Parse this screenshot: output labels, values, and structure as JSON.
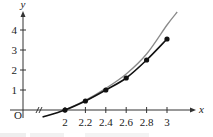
{
  "chart_data": {
    "type": "line",
    "title": "",
    "xlabel": "x",
    "ylabel": "y",
    "origin_label": "O",
    "x_ticks": [
      2,
      2.2,
      2.4,
      2.6,
      2.8,
      3
    ],
    "x_tick_labels": [
      "2",
      "2.2",
      "2.4",
      "2.6",
      "2.8",
      "3"
    ],
    "y_ticks": [
      1,
      2,
      3,
      4
    ],
    "y_tick_labels": [
      "1",
      "2",
      "3",
      "4"
    ],
    "xlim": [
      1.6,
      3.28
    ],
    "ylim": [
      0,
      4.8
    ],
    "axis_break": "x-axis break between 0 and 2",
    "grid": false,
    "legend": null,
    "series": [
      {
        "name": "approximation (points)",
        "style": "black line with dot markers",
        "color": "#111111",
        "x": [
          2,
          2.2,
          2.4,
          2.6,
          2.8,
          3
        ],
        "values": [
          0,
          0.45,
          1.0,
          1.6,
          2.5,
          3.55
        ],
        "extends_left_to": {
          "x": 1.78,
          "y": -0.35
        }
      },
      {
        "name": "exact curve",
        "style": "gray smooth curve",
        "color": "#8a8a8a",
        "x": [
          2,
          2.2,
          2.4,
          2.6,
          2.8,
          3,
          3.1
        ],
        "values": [
          0,
          0.48,
          1.08,
          1.8,
          2.8,
          4.25,
          4.9
        ]
      }
    ]
  }
}
